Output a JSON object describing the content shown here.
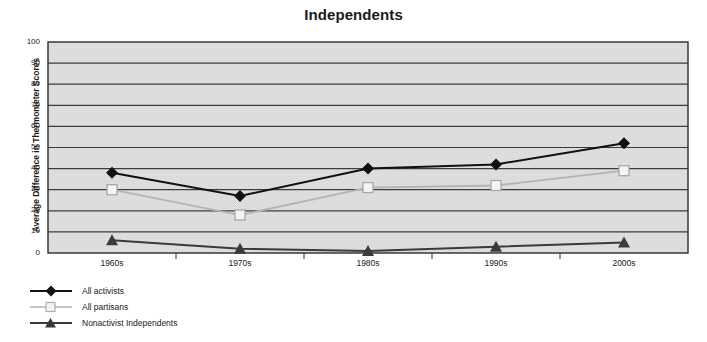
{
  "chart_data": {
    "type": "line",
    "title": "Independents",
    "xlabel": "",
    "ylabel": "Average Difference in Thermometer Scores",
    "categories": [
      "1960s",
      "1970s",
      "1980s",
      "1990s",
      "2000s"
    ],
    "ylim": [
      0,
      100
    ],
    "ytick_values": [
      0,
      10,
      20,
      30,
      40,
      50,
      60,
      70,
      80,
      90,
      100
    ],
    "grid": "horizontal",
    "legend_position": "below-left",
    "series": [
      {
        "name": "All activists",
        "marker": "filled-diamond",
        "color": "#111111",
        "values": [
          38,
          27,
          40,
          42,
          52
        ]
      },
      {
        "name": "All partisans",
        "marker": "open-square",
        "color": "#b3b3b3",
        "values": [
          30,
          18,
          31,
          32,
          39
        ]
      },
      {
        "name": "Nonactivist Independents",
        "marker": "filled-triangle",
        "color": "#3a3a3a",
        "values": [
          6,
          2,
          1,
          3,
          5
        ]
      }
    ]
  },
  "plot": {
    "background_color": "#e2e2e2",
    "border_color": "#2b2b2b",
    "gridline_color": "#3c3c3c"
  }
}
